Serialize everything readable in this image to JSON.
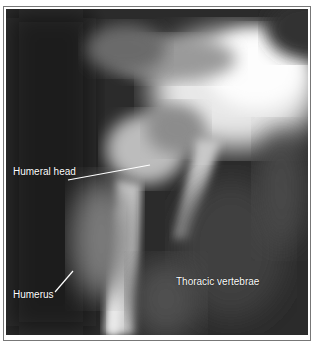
{
  "figure": {
    "labels": [
      {
        "id": "humeral-head",
        "text": "Humeral head"
      },
      {
        "id": "humerus",
        "text": "Humerus"
      },
      {
        "id": "thoracic-vertebrae",
        "text": "Thoracic vertebrae"
      }
    ]
  }
}
